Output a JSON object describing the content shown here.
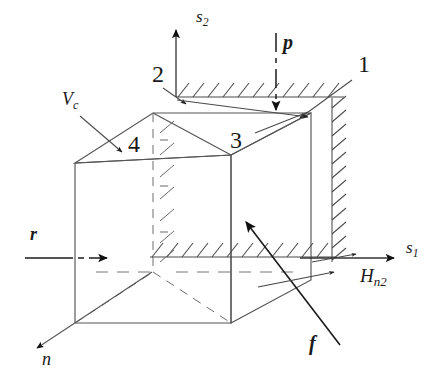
{
  "figure": {
    "type": "technical-line-diagram",
    "background_color": "#ffffff",
    "line_color": "#3d3d3d",
    "bold_line_color": "#1a1a1a",
    "text_color": "#1a1a1a"
  },
  "axes": [
    {
      "id": "s2",
      "label": "s",
      "subscript": "2",
      "style": "italic",
      "direction": "up",
      "label_x": 196,
      "label_y": 22
    },
    {
      "id": "s1",
      "label": "s",
      "subscript": "1",
      "style": "italic",
      "direction": "right",
      "label_x": 406,
      "label_y": 253
    },
    {
      "id": "n",
      "label": "n",
      "subscript": "",
      "style": "italic",
      "direction": "down-left",
      "label_x": 42,
      "label_y": 365
    }
  ],
  "vectors": [
    {
      "id": "p",
      "label": "p",
      "subscript": "",
      "style": "bold-italic",
      "description": "downward load arrow on top face",
      "label_x": 283,
      "label_y": 49
    },
    {
      "id": "r",
      "label": "r",
      "subscript": "",
      "style": "bold-italic",
      "description": "rightward reaction arrow on left face",
      "label_x": 30,
      "label_y": 240
    },
    {
      "id": "f",
      "label": "f",
      "subscript": "",
      "style": "bold-italic",
      "description": "diagonal friction arrow pointing up-left",
      "label_x": 309,
      "label_y": 350
    },
    {
      "id": "Hn2",
      "label": "H",
      "subscript": "n2",
      "style": "italic",
      "description": "horizontal arrow along lower right edge",
      "label_x": 360,
      "label_y": 282
    }
  ],
  "callouts": [
    {
      "id": "vc",
      "label": "V",
      "subscript": "c",
      "style": "italic",
      "description": "leader line to upper-left chamfer edge",
      "label_x": 62,
      "label_y": 105
    },
    {
      "id": "face-1",
      "label": "1",
      "subscript": "",
      "style": "plain",
      "description": "leader line to top-right rear corner",
      "label_x": 358,
      "label_y": 72
    },
    {
      "id": "face-2",
      "label": "2",
      "subscript": "",
      "style": "plain",
      "description": "leader line to top-left rear corner",
      "label_x": 152,
      "label_y": 82
    },
    {
      "id": "face-3",
      "label": "3",
      "subscript": "",
      "style": "plain",
      "description": "top face of the cube",
      "label_x": 230,
      "label_y": 148
    },
    {
      "id": "face-4",
      "label": "4",
      "subscript": "",
      "style": "plain",
      "description": "upper-left chamfer face of the cube",
      "label_x": 128,
      "label_y": 152
    }
  ],
  "hatching": [
    {
      "id": "top-wall",
      "orientation": "horizontal",
      "side": "above",
      "description": "fixed boundary above top face"
    },
    {
      "id": "right-wall",
      "orientation": "vertical",
      "side": "right",
      "description": "fixed boundary right of cube"
    },
    {
      "id": "bottom-wall",
      "orientation": "horizontal",
      "side": "below",
      "description": "fixed boundary at base plane"
    },
    {
      "id": "inner-wall",
      "orientation": "vertical",
      "side": "hidden",
      "description": "internal hidden boundary plane"
    }
  ]
}
